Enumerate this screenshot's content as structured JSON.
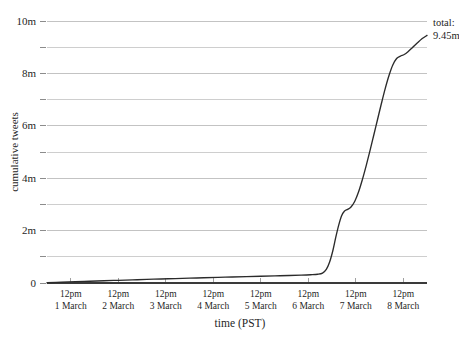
{
  "chart_data": {
    "type": "line",
    "title": "",
    "xlabel": "time (PST)",
    "ylabel": "cumulative tweets",
    "xlim": [
      0,
      8
    ],
    "ylim": [
      0,
      10
    ],
    "grid": true,
    "legend": "none",
    "y_ticks": [
      {
        "value": 10,
        "label": "10m",
        "major": true
      },
      {
        "value": 9,
        "label": "",
        "major": false
      },
      {
        "value": 8,
        "label": "8m",
        "major": true
      },
      {
        "value": 7,
        "label": "",
        "major": false
      },
      {
        "value": 6,
        "label": "6m",
        "major": true
      },
      {
        "value": 5,
        "label": "",
        "major": false
      },
      {
        "value": 4,
        "label": "4m",
        "major": true
      },
      {
        "value": 3,
        "label": "",
        "major": false
      },
      {
        "value": 2,
        "label": "2m",
        "major": true
      },
      {
        "value": 1,
        "label": "",
        "major": false
      },
      {
        "value": 0,
        "label": "0",
        "major": true
      }
    ],
    "x_ticks": [
      {
        "value": 0.5,
        "time": "12pm",
        "date": "1 March"
      },
      {
        "value": 1.5,
        "time": "12pm",
        "date": "2 March"
      },
      {
        "value": 2.5,
        "time": "12pm",
        "date": "3 March"
      },
      {
        "value": 3.5,
        "time": "12pm",
        "date": "4 March"
      },
      {
        "value": 4.5,
        "time": "12pm",
        "date": "5 March"
      },
      {
        "value": 5.5,
        "time": "12pm",
        "date": "6 March"
      },
      {
        "value": 6.5,
        "time": "12pm",
        "date": "7 March"
      },
      {
        "value": 7.5,
        "time": "12pm",
        "date": "8 March"
      }
    ],
    "series": [
      {
        "name": "cumulative tweets",
        "units": "millions",
        "color": "#2b2b2b",
        "points": [
          [
            0.0,
            0.01
          ],
          [
            0.3,
            0.03
          ],
          [
            0.6,
            0.05
          ],
          [
            0.9,
            0.068
          ],
          [
            1.2,
            0.086
          ],
          [
            1.5,
            0.103
          ],
          [
            1.8,
            0.12
          ],
          [
            2.1,
            0.137
          ],
          [
            2.4,
            0.153
          ],
          [
            2.7,
            0.169
          ],
          [
            3.0,
            0.185
          ],
          [
            3.3,
            0.2
          ],
          [
            3.6,
            0.215
          ],
          [
            3.9,
            0.23
          ],
          [
            4.2,
            0.244
          ],
          [
            4.5,
            0.258
          ],
          [
            4.8,
            0.272
          ],
          [
            5.1,
            0.287
          ],
          [
            5.35,
            0.3
          ],
          [
            5.55,
            0.315
          ],
          [
            5.7,
            0.335
          ],
          [
            5.8,
            0.38
          ],
          [
            5.88,
            0.52
          ],
          [
            5.95,
            0.8
          ],
          [
            6.02,
            1.25
          ],
          [
            6.08,
            1.75
          ],
          [
            6.14,
            2.2
          ],
          [
            6.2,
            2.56
          ],
          [
            6.26,
            2.74
          ],
          [
            6.33,
            2.81
          ],
          [
            6.4,
            2.9
          ],
          [
            6.48,
            3.12
          ],
          [
            6.56,
            3.48
          ],
          [
            6.64,
            3.95
          ],
          [
            6.72,
            4.48
          ],
          [
            6.8,
            5.05
          ],
          [
            6.88,
            5.65
          ],
          [
            6.96,
            6.25
          ],
          [
            7.04,
            6.85
          ],
          [
            7.12,
            7.42
          ],
          [
            7.2,
            7.92
          ],
          [
            7.28,
            8.32
          ],
          [
            7.36,
            8.57
          ],
          [
            7.44,
            8.66
          ],
          [
            7.52,
            8.72
          ],
          [
            7.6,
            8.83
          ],
          [
            7.7,
            9.0
          ],
          [
            7.8,
            9.17
          ],
          [
            7.9,
            9.33
          ],
          [
            8.0,
            9.45
          ]
        ]
      }
    ],
    "annotations": [
      {
        "name": "total-annotation",
        "line1": "total:",
        "line2": "9.45m",
        "at_x": 8.0,
        "at_y": 9.45
      }
    ]
  }
}
